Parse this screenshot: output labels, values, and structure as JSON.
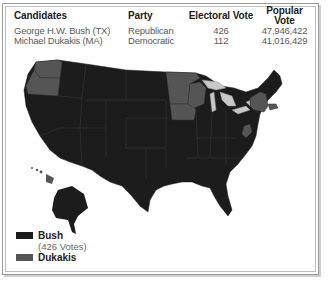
{
  "results": {
    "headers": {
      "candidates": "Candidates",
      "party": "Party",
      "electoral": "Electoral Vote",
      "popular": "Popular Vote"
    },
    "rows": [
      {
        "candidate": "George H.W. Bush (TX)",
        "party": "Republican",
        "electoral": "426",
        "popular": "47,946,422"
      },
      {
        "candidate": "Michael Dukakis (MA)",
        "party": "Democratic",
        "electoral": "112",
        "popular": "41,016,429"
      }
    ]
  },
  "legend": {
    "items": [
      {
        "label": "Bush",
        "sub": "(426 Votes)",
        "color": "#1c1c1c"
      },
      {
        "label": "Dukakis",
        "sub": "",
        "color": "#555555"
      }
    ]
  },
  "map": {
    "colors": {
      "bush": "#1c1c1c",
      "dukakis": "#555555",
      "lakes": "#c8c8c8",
      "borders": "#3a3a3a"
    },
    "stateCoverage": {
      "dukakis": [
        "WA",
        "OR",
        "MN",
        "IA",
        "WI",
        "NY",
        "MA",
        "RI",
        "WV",
        "HI",
        "DC"
      ],
      "bush": [
        "all other states including AK"
      ]
    }
  }
}
